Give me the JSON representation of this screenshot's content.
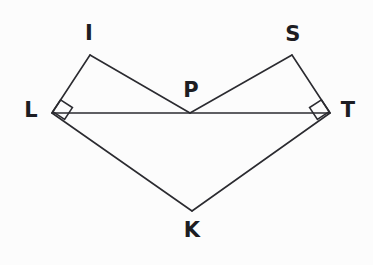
{
  "figure": {
    "background_color": "#fcfcfc",
    "stroke_color": "#2b2b30",
    "label_color": "#1d1d22",
    "width": 373,
    "height": 265,
    "vertices": [
      {
        "id": "I",
        "label": "I",
        "x": 90,
        "y": 55,
        "label_x": 89,
        "label_y": 33
      },
      {
        "id": "S",
        "label": "S",
        "x": 292,
        "y": 55,
        "label_x": 293,
        "label_y": 34
      },
      {
        "id": "P",
        "label": "P",
        "x": 190,
        "y": 113,
        "label_x": 191,
        "label_y": 90
      },
      {
        "id": "L",
        "label": "L",
        "x": 52,
        "y": 113,
        "label_x": 31,
        "label_y": 110
      },
      {
        "id": "T",
        "label": "T",
        "x": 330,
        "y": 113,
        "label_x": 348,
        "label_y": 110
      },
      {
        "id": "K",
        "label": "K",
        "x": 192,
        "y": 211,
        "label_x": 192,
        "label_y": 230
      }
    ],
    "segments": [
      {
        "name": "segment-L-I",
        "from": "L",
        "to": "I"
      },
      {
        "name": "segment-I-P",
        "from": "I",
        "to": "P"
      },
      {
        "name": "segment-P-S",
        "from": "P",
        "to": "S"
      },
      {
        "name": "segment-S-T",
        "from": "S",
        "to": "T"
      },
      {
        "name": "segment-L-T",
        "from": "L",
        "to": "T"
      },
      {
        "name": "segment-L-K",
        "from": "L",
        "to": "K"
      },
      {
        "name": "segment-K-T",
        "from": "K",
        "to": "T"
      }
    ],
    "right_angles": [
      {
        "name": "right-angle-at-L",
        "vertex": "L",
        "between": [
          "I",
          "K"
        ]
      },
      {
        "name": "right-angle-at-T",
        "vertex": "T",
        "between": [
          "S",
          "K"
        ]
      }
    ]
  }
}
